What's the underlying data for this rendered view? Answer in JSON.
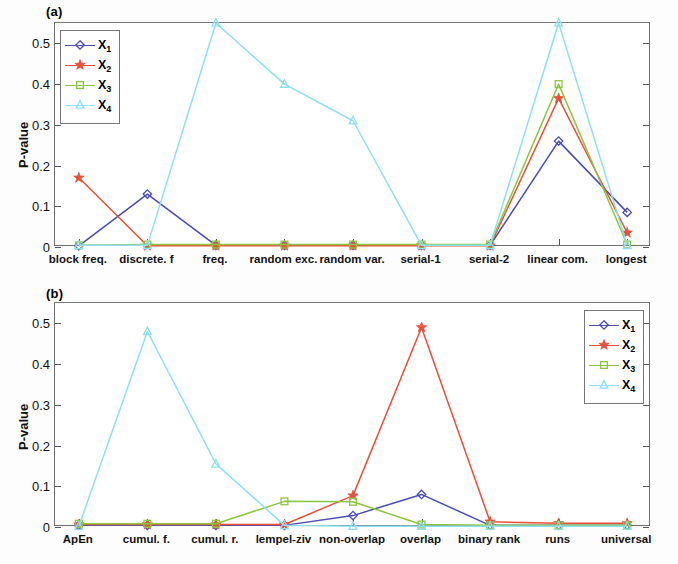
{
  "figure": {
    "panels": [
      {
        "tag": "(a)",
        "ylabel": "P-value"
      },
      {
        "tag": "(b)",
        "ylabel": "P-value"
      }
    ],
    "series_colors": {
      "X1": "#4a4ab8",
      "X2": "#e8503a",
      "X3": "#8cc63f",
      "X4": "#8ee0f0"
    },
    "series_markers": {
      "X1": "diamond-marker",
      "X2": "star-marker",
      "X3": "square-marker",
      "X4": "triangle-marker"
    },
    "legend_labels": [
      "X",
      "X",
      "X",
      "X"
    ],
    "legend_subs": [
      "1",
      "2",
      "3",
      "4"
    ],
    "legend_position_a": "top-left",
    "legend_position_b": "top-right"
  },
  "chart_data": [
    {
      "type": "line",
      "title": "(a)",
      "xlabel": "",
      "ylabel": "P-value",
      "ylim": [
        0,
        0.55
      ],
      "yticks": [
        "0",
        "0.1",
        "0.2",
        "0.3",
        "0.4",
        "0.5"
      ],
      "ytickvals": [
        0,
        0.1,
        0.2,
        0.3,
        0.4,
        0.5
      ],
      "grid": false,
      "legend": "top-left",
      "categories": [
        "block freq.",
        "discrete. f",
        "freq.",
        "random exc.",
        "random var.",
        "serial-1",
        "serial-2",
        "linear com.",
        "longest"
      ],
      "series": [
        {
          "name": "X1",
          "color": "#4a4ab8",
          "marker": "diamond",
          "values": [
            0.003,
            0.13,
            0.004,
            0.004,
            0.004,
            0.004,
            0.004,
            0.26,
            0.085
          ]
        },
        {
          "name": "X2",
          "color": "#e8503a",
          "marker": "star",
          "values": [
            0.17,
            0.003,
            0.003,
            0.003,
            0.003,
            0.003,
            0.003,
            0.365,
            0.035
          ]
        },
        {
          "name": "X3",
          "color": "#8cc63f",
          "marker": "square",
          "values": [
            0.004,
            0.006,
            0.006,
            0.006,
            0.006,
            0.006,
            0.006,
            0.4,
            0.006
          ]
        },
        {
          "name": "X4",
          "color": "#8ee0f0",
          "marker": "triangle",
          "values": [
            0.004,
            0.004,
            0.55,
            0.4,
            0.31,
            0.004,
            0.004,
            0.55,
            0.004
          ]
        }
      ]
    },
    {
      "type": "line",
      "title": "(b)",
      "xlabel": "",
      "ylabel": "P-value",
      "ylim": [
        0,
        0.55
      ],
      "yticks": [
        "0",
        "0.1",
        "0.2",
        "0.3",
        "0.4",
        "0.5"
      ],
      "ytickvals": [
        0,
        0.1,
        0.2,
        0.3,
        0.4,
        0.5
      ],
      "grid": false,
      "legend": "top-right",
      "categories": [
        "ApEn",
        "cumul. f.",
        "cumul. r.",
        "lempel-ziv",
        "non-overlap",
        "overlap",
        "binary rank",
        "runs",
        "universal"
      ],
      "series": [
        {
          "name": "X1",
          "color": "#4a4ab8",
          "marker": "diamond",
          "values": [
            0.004,
            0.004,
            0.004,
            0.004,
            0.028,
            0.08,
            0.004,
            0.004,
            0.004
          ]
        },
        {
          "name": "X2",
          "color": "#e8503a",
          "marker": "star",
          "values": [
            0.006,
            0.006,
            0.006,
            0.006,
            0.077,
            0.49,
            0.013,
            0.009,
            0.009
          ]
        },
        {
          "name": "X3",
          "color": "#8cc63f",
          "marker": "square",
          "values": [
            0.008,
            0.008,
            0.008,
            0.063,
            0.062,
            0.006,
            0.004,
            0.004,
            0.004
          ]
        },
        {
          "name": "X4",
          "color": "#8ee0f0",
          "marker": "triangle",
          "values": [
            0.002,
            0.48,
            0.155,
            0.004,
            0.002,
            0.002,
            0.002,
            0.002,
            0.002
          ]
        }
      ]
    }
  ]
}
